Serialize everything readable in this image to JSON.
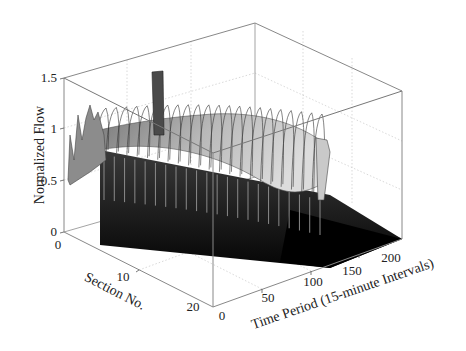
{
  "chart_data": {
    "type": "surface3d",
    "title": "",
    "xlabel": "Section No.",
    "ylabel": "Time Period (15-minute Intervals)",
    "zlabel": "Normalized Flow",
    "x_ticks": [
      "0",
      "10",
      "20"
    ],
    "y_ticks": [
      "0",
      "50",
      "100",
      "150",
      "200"
    ],
    "z_ticks": [
      "0",
      "0.5",
      "1",
      "1.5"
    ],
    "xlim": [
      0,
      22
    ],
    "ylim": [
      0,
      220
    ],
    "zlim": [
      0,
      1.5
    ],
    "grid": true,
    "colormap": "gray",
    "sections": 22,
    "time_periods_with_flow": 96,
    "time_periods_total": 220,
    "series": [
      {
        "name": "section_profile_peak",
        "x": [
          0,
          1,
          2,
          3,
          4,
          5,
          6,
          8,
          10,
          12,
          14,
          16,
          18,
          20,
          21
        ],
        "values": [
          0.6,
          1.3,
          1.0,
          1.35,
          1.3,
          1.1,
          0.9,
          0.85,
          0.9,
          0.95,
          1.0,
          1.05,
          1.05,
          1.0,
          0.95
        ]
      },
      {
        "name": "section_profile_trough",
        "x": [
          0,
          5,
          10,
          15,
          20,
          21
        ],
        "values": [
          0.55,
          0.6,
          0.55,
          0.5,
          0.5,
          0.5
        ]
      }
    ],
    "spike": {
      "section": 9,
      "value": 1.5
    }
  },
  "labels": {
    "zlabel": "Normalized Flow",
    "xlabel": "Section No.",
    "ylabel": "Time Period (15-minute Intervals)"
  },
  "ticks": {
    "z": [
      "0",
      "0.5",
      "1",
      "1.5"
    ],
    "x": [
      "0",
      "10",
      "20"
    ],
    "y": [
      "0",
      "50",
      "100",
      "150",
      "200"
    ]
  }
}
